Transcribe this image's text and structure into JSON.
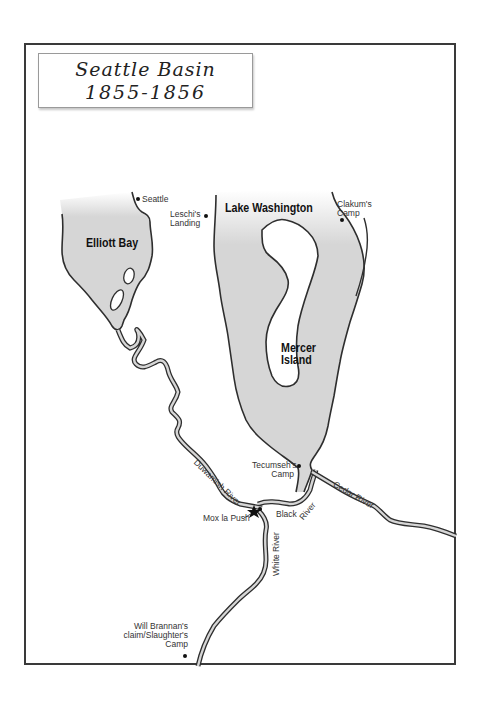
{
  "map": {
    "title": {
      "line1": "Seattle Basin",
      "line2": "1855-1856"
    },
    "water_bodies": [
      {
        "name": "Elliott Bay"
      },
      {
        "name": "Lake Washington"
      },
      {
        "name": "Mercer Island",
        "type": "island"
      }
    ],
    "rivers": [
      {
        "name": "Duwamish River"
      },
      {
        "name": "Black River"
      },
      {
        "name": "Cedar River"
      },
      {
        "name": "White River"
      }
    ],
    "places": [
      {
        "name": "Seattle"
      },
      {
        "name": "Leschi's Landing",
        "line1": "Leschi's",
        "line2": "Landing"
      },
      {
        "name": "Clakum's Camp",
        "line1": "Clakum's",
        "line2": "Camp"
      },
      {
        "name": "Tecumseh's Camp",
        "line1": "Tecumseh's",
        "line2": "Camp"
      },
      {
        "name": "Mox la Push"
      },
      {
        "name": "Will Brannan's claim/Slaughter's Camp",
        "line1": "Will Brannan's",
        "line2": "claim/Slaughter's",
        "line3": "Camp"
      }
    ],
    "colors": {
      "water": "#d6d6d6",
      "outline": "#2e2e2e",
      "frame": "#3a3a3a"
    }
  }
}
